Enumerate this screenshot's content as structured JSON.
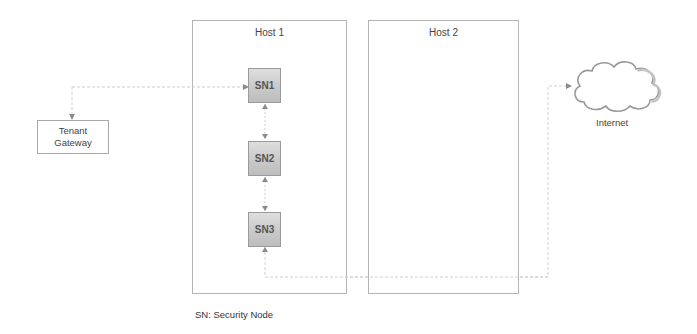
{
  "diagram": {
    "hosts": [
      {
        "id": "host1",
        "label": "Host 1"
      },
      {
        "id": "host2",
        "label": "Host 2"
      }
    ],
    "security_nodes": [
      {
        "id": "sn1",
        "label": "SN1"
      },
      {
        "id": "sn2",
        "label": "SN2"
      },
      {
        "id": "sn3",
        "label": "SN3"
      }
    ],
    "tenant_gateway": {
      "line1": "Tenant",
      "line2": "Gateway"
    },
    "internet": {
      "label": "Internet"
    },
    "legend": "SN: Security Node",
    "colors": {
      "border": "#b5b5b5",
      "node_fill_top": "#dedede",
      "node_fill_bottom": "#bdbdbd",
      "connector": "#c8c8c8"
    },
    "connections": [
      {
        "from": "Tenant Gateway",
        "to": "SN1"
      },
      {
        "from": "SN1",
        "to": "SN2"
      },
      {
        "from": "SN2",
        "to": "SN3"
      },
      {
        "from": "SN3",
        "to": "Internet"
      }
    ]
  }
}
